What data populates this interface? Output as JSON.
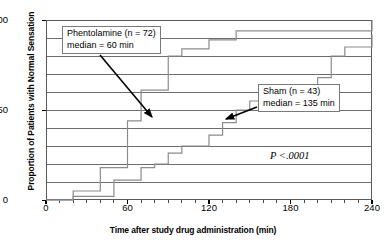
{
  "chart_data": {
    "type": "line",
    "subtype": "step-kaplan-meier",
    "title": "",
    "xlabel": "Time after study drug administration (min)",
    "ylabel": "Proportion of Patients with Normal Sensation",
    "xlim": [
      0,
      240
    ],
    "ylim": [
      0,
      100
    ],
    "xticks": [
      0,
      60,
      120,
      180,
      240
    ],
    "xtick_labels": [
      "0",
      "60",
      "120",
      "180",
      "240"
    ],
    "xminor_tick_interval": 10,
    "yticks": [
      0,
      50,
      100
    ],
    "ytick_labels": [
      "0",
      "50",
      "100"
    ],
    "ygrid_interval": 10,
    "grid": "horizontal",
    "legend": "none",
    "line_color": "#8c8c8c",
    "axis_color": "#5a5a5a",
    "series": [
      {
        "name": "Phentolamine",
        "n": 72,
        "median_min": 60,
        "x": [
          0,
          10,
          20,
          30,
          40,
          50,
          60,
          70,
          80,
          90,
          100,
          110,
          120,
          130,
          140,
          150,
          240
        ],
        "y": [
          0,
          0,
          5,
          5,
          18,
          18,
          44,
          61,
          61,
          80,
          84,
          84,
          89,
          89,
          94,
          94,
          100
        ]
      },
      {
        "name": "Sham",
        "n": 43,
        "median_min": 135,
        "x": [
          0,
          10,
          20,
          30,
          40,
          50,
          60,
          70,
          80,
          90,
          100,
          110,
          120,
          130,
          140,
          150,
          160,
          170,
          180,
          190,
          200,
          210,
          220,
          230,
          240
        ],
        "y": [
          0,
          0,
          2,
          2,
          2,
          11,
          11,
          18,
          20,
          26,
          30,
          30,
          36,
          43,
          50,
          55,
          55,
          63,
          63,
          63,
          68,
          80,
          85,
          85,
          92
        ]
      }
    ],
    "annotations": [
      {
        "id": "phentolamine",
        "lines": [
          "Phentolamine (n = 72)",
          "median = 60 min"
        ],
        "arrow_from": [
          100,
          55
        ],
        "arrow_to": [
          152,
          117
        ]
      },
      {
        "id": "sham",
        "lines": [
          "Sham (n = 43)",
          "median = 135 min"
        ],
        "arrow_from": [
          257,
          107
        ],
        "arrow_to": [
          226,
          119
        ]
      },
      {
        "id": "pvalue",
        "lines": [
          "P <.0001"
        ]
      }
    ]
  },
  "axes": {
    "y": {
      "title": "Proportion of Patients with Normal Sensation",
      "ticks": [
        {
          "value": 100,
          "label": "100"
        },
        {
          "value": 50,
          "label": "50"
        },
        {
          "value": 0,
          "label": "0"
        }
      ]
    },
    "x": {
      "title": "Time after study drug administration (min)",
      "ticks": [
        {
          "value": 0,
          "label": "0"
        },
        {
          "value": 60,
          "label": "60"
        },
        {
          "value": 120,
          "label": "120"
        },
        {
          "value": 180,
          "label": "180"
        },
        {
          "value": 240,
          "label": "240"
        }
      ]
    }
  },
  "annotations": {
    "phentolamine": {
      "line1": "Phentolamine (n = 72)",
      "line2": "median = 60 min"
    },
    "sham": {
      "line1": "Sham (n = 43)",
      "line2": "median = 135 min"
    },
    "pvalue": {
      "text": "P <.0001"
    }
  },
  "colors": {
    "curve": "#8c8c8c",
    "grid": "#6e6e6e",
    "axis": "#5a5a5a",
    "arrow": "#000000",
    "background": "#ffffff"
  }
}
